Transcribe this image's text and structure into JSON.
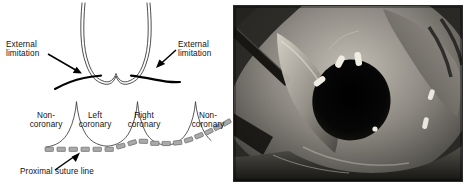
{
  "figure": {
    "type": "surgical-technique-illustration",
    "panels": [
      "schematic-diagram",
      "intraoperative-photograph"
    ]
  },
  "diagram": {
    "labels": {
      "external_limitation_left": "External\nlimitation",
      "external_limitation_right": "External\nlimitation",
      "noncoronary_left": "Non-\ncoronary",
      "left_coronary": "Left\ncoronary",
      "right_coronary": "Right\ncoronary",
      "noncoronary_right": "Non-\ncoronary",
      "proximal_suture_line": "Proximal suture line"
    },
    "colors": {
      "outline": "#3a3a3a",
      "external_limitation_stroke": "#000000",
      "suture_dash_fill": "#a9a9a9",
      "suture_dash_stroke": "#6b6b6b",
      "arrow": "#000000",
      "background": "#ffffff"
    },
    "elements": {
      "upper_scallop_count": 2,
      "lower_cusp_count": 3,
      "suture_dash_count": 17,
      "arrow_count": 3
    }
  },
  "photograph": {
    "description": "Intraoperative view of aortic root with dark valve orifice",
    "modality": "grayscale",
    "features": [
      "surgical-retractor",
      "aortic-wall-tissue",
      "valve-orifice",
      "suture-stitches"
    ],
    "colors": {
      "border": "#2b2b2b",
      "dark_orifice": "#080808",
      "tissue_light": "#b9b5ae",
      "tissue_mid": "#7d7a74",
      "tissue_dark": "#3a3834",
      "suture_white": "#f2efe8"
    }
  }
}
